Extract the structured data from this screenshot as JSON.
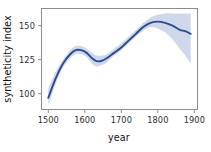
{
  "chart_data": {
    "type": "line",
    "title": "",
    "xlabel": "year",
    "ylabel": "syntheticity index",
    "xlim": [
      1480,
      1910
    ],
    "ylim": [
      88,
      163
    ],
    "grid": false,
    "legend": null,
    "x_ticks": [
      1500,
      1600,
      1700,
      1800,
      1900
    ],
    "x_tick_labels": [
      "1500",
      "1600",
      "1700",
      "1800",
      "1900"
    ],
    "y_ticks": [
      100,
      125,
      150
    ],
    "y_tick_labels": [
      "100",
      "125",
      "150"
    ],
    "line_color": "#2a4d8f",
    "band_color": "#ccd6ea",
    "series": [
      {
        "name": "syntheticity index",
        "x": [
          1500,
          1520,
          1540,
          1560,
          1575,
          1590,
          1605,
          1620,
          1632,
          1645,
          1660,
          1680,
          1700,
          1720,
          1740,
          1760,
          1780,
          1800,
          1820,
          1840,
          1860,
          1875,
          1890
        ],
        "values": [
          97,
          111,
          122,
          129,
          132,
          132,
          130,
          126,
          124,
          124,
          126,
          130,
          134,
          139,
          144,
          149,
          152,
          153,
          152,
          150,
          147,
          146,
          144
        ],
        "ci_low": [
          91,
          107,
          119,
          126,
          129,
          129,
          127,
          122,
          120,
          121,
          123,
          128,
          132,
          137,
          142,
          146,
          149,
          148,
          145,
          140,
          133,
          128,
          122
        ],
        "ci_high": [
          104,
          116,
          125,
          132,
          135,
          135,
          133,
          130,
          128,
          128,
          129,
          133,
          137,
          142,
          147,
          152,
          156,
          158,
          159,
          159,
          159,
          159,
          159
        ]
      }
    ]
  },
  "axes": {
    "x_title": "year",
    "y_title": "syntheticity index"
  }
}
